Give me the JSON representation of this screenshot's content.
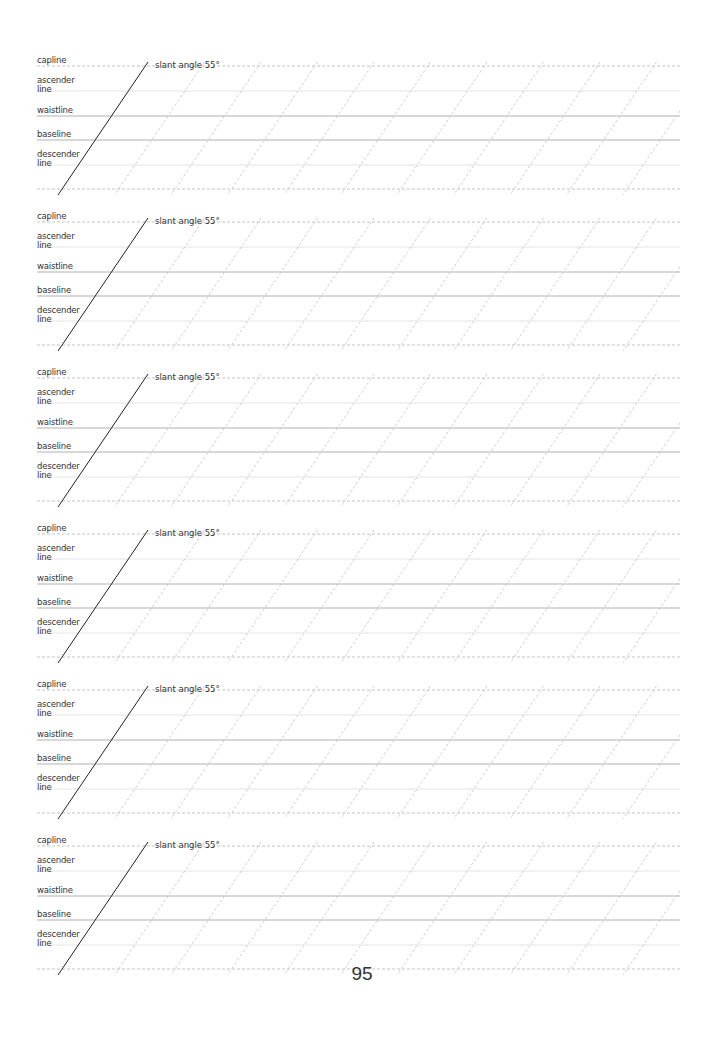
{
  "page": {
    "number": "95",
    "block_count": 6
  },
  "block": {
    "slant_label": "slant angle 55°",
    "labels": {
      "capline": "capline",
      "ascender": "ascender line",
      "ascender_l1": "ascender",
      "ascender_l2": "line",
      "waistline": "waistline",
      "baseline": "baseline",
      "descender_l1": "descender",
      "descender_l2": "line"
    },
    "line_offsets_px": {
      "capline": 0,
      "ascender": 25,
      "waistline": 50,
      "baseline": 74,
      "descender": 99,
      "bottom": 123
    }
  },
  "blocks": [
    {
      "top": 66
    },
    {
      "top": 222
    },
    {
      "top": 378
    },
    {
      "top": 534
    },
    {
      "top": 690
    },
    {
      "top": 846
    }
  ],
  "colors": {
    "label_text": "#333333",
    "main_slant": "#222222",
    "guide_slant": "#bbbbbb",
    "strong_line": "#a8a8a8",
    "light_line": "#dcdcdc",
    "dashed_line": "#b5b5b5"
  }
}
